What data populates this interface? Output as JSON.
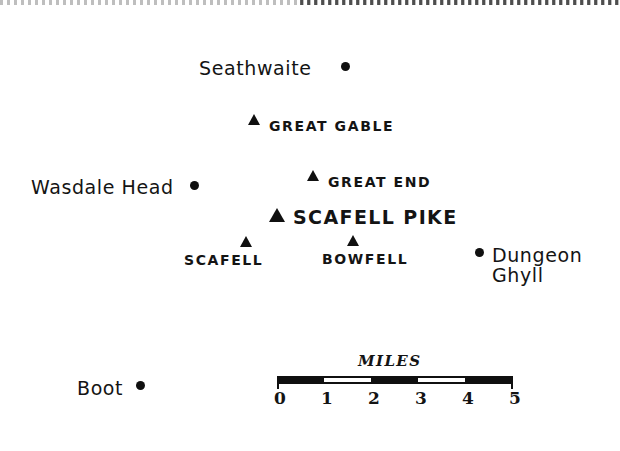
{
  "map": {
    "title": "Scafell Pike area sketch map",
    "background_color": "#ffffff",
    "ink_color": "#141414",
    "width": 620,
    "height": 451
  },
  "settlements": [
    {
      "name": "Seathwaite",
      "label": "Seathwaite",
      "marker": "dot",
      "label_x": 199,
      "label_y": 57,
      "dot_x": 341,
      "dot_y": 62,
      "two_line": false
    },
    {
      "name": "Wasdale Head",
      "label": "Wasdale Head",
      "marker": "dot",
      "label_x": 31,
      "label_y": 176,
      "dot_x": 190,
      "dot_y": 181,
      "two_line": false
    },
    {
      "name": "Dungeon Ghyll",
      "label": "Dungeon Ghyll",
      "marker": "dot",
      "label_x": 492,
      "label_y": 245,
      "dot_x": 475,
      "dot_y": 248,
      "two_line": true
    },
    {
      "name": "Boot",
      "label": "Boot",
      "marker": "dot",
      "label_x": 77,
      "label_y": 377,
      "dot_x": 136,
      "dot_y": 381,
      "two_line": false
    }
  ],
  "peaks": [
    {
      "name": "Great Gable",
      "label": "GREAT GABLE",
      "marker": "triangle",
      "size": "small",
      "tri_x": 248,
      "tri_y": 114,
      "label_x": 269,
      "label_y": 118,
      "label_size": "small"
    },
    {
      "name": "Great End",
      "label": "GREAT END",
      "marker": "triangle",
      "size": "small",
      "tri_x": 307,
      "tri_y": 170,
      "label_x": 328,
      "label_y": 174,
      "label_size": "small"
    },
    {
      "name": "Scafell Pike",
      "label": "SCAFELL PIKE",
      "marker": "triangle",
      "size": "big",
      "tri_x": 269,
      "tri_y": 208,
      "label_x": 293,
      "label_y": 206,
      "label_size": "major"
    },
    {
      "name": "Scafell",
      "label": "SCAFELL",
      "marker": "triangle",
      "size": "small",
      "tri_x": 240,
      "tri_y": 236,
      "label_x": 184,
      "label_y": 252,
      "label_size": "small"
    },
    {
      "name": "Bowfell",
      "label": "BOWFELL",
      "marker": "triangle",
      "size": "small",
      "tri_x": 347,
      "tri_y": 235,
      "label_x": 322,
      "label_y": 251,
      "label_size": "small"
    }
  ],
  "scale": {
    "title": "MILES",
    "unit": "miles",
    "min": 0,
    "max": 5,
    "tick_labels": [
      "0",
      "1",
      "2",
      "3",
      "4",
      "5"
    ],
    "tick_positions_px": [
      7,
      54,
      101,
      148,
      195,
      243
    ],
    "alternating_white_segments": [
      {
        "start_px": 54,
        "width_px": 47
      },
      {
        "start_px": 148,
        "width_px": 47
      }
    ]
  }
}
